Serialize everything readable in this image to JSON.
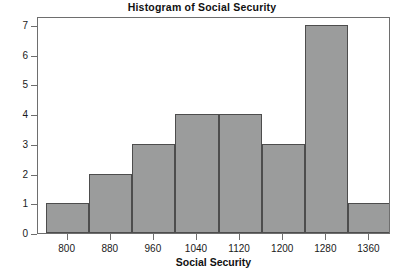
{
  "chart_data": {
    "type": "bar",
    "title": "Histogram of Social Security",
    "xlabel": "Social Security",
    "ylabel": "Frequency",
    "categories": [
      "760-840",
      "840-920",
      "920-1000",
      "1000-1080",
      "1080-1160",
      "1160-1240",
      "1240-1320",
      "1320-1400"
    ],
    "bin_edges": [
      760,
      840,
      920,
      1000,
      1080,
      1160,
      1240,
      1320,
      1400
    ],
    "values": [
      1,
      2,
      3,
      4,
      4,
      3,
      7,
      1
    ],
    "xlim": [
      745,
      1400
    ],
    "ylim": [
      0,
      7.3
    ],
    "xticks": [
      800,
      880,
      960,
      1040,
      1120,
      1200,
      1280,
      1360
    ],
    "xtick_labels": [
      "800",
      "880",
      "960",
      "1040",
      "1120",
      "1200",
      "1280",
      "1360"
    ],
    "yticks": [
      0,
      1,
      2,
      3,
      4,
      5,
      6,
      7
    ],
    "ytick_labels": [
      "0",
      "1",
      "2",
      "3",
      "4",
      "5",
      "6",
      "7"
    ],
    "grid": false,
    "legend": null,
    "bar_fill_color": "#9b9c9c",
    "bar_border_color": "#4d4d4d",
    "axis_color": "#6e6e6e",
    "background_color": "#ffffff"
  }
}
